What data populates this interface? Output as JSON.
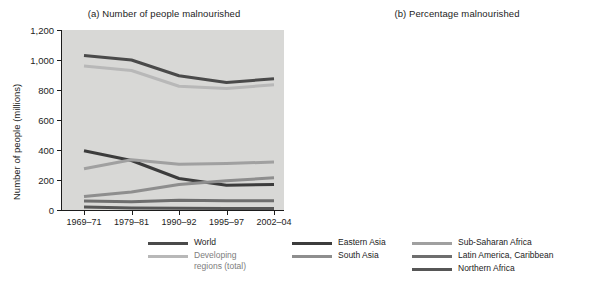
{
  "figure": {
    "panel_a_title": "(a) Number of people malnourished",
    "panel_b_title": "(b) Percentage malnourished"
  },
  "legend": {
    "items": [
      {
        "label": "World",
        "color": "#4a4a4a"
      },
      {
        "label": "Developing\nregions (total)",
        "color": "#b8b8b8"
      },
      {
        "label": "Eastern Asia",
        "color": "#3c3c3c"
      },
      {
        "label": "South Asia",
        "color": "#8e8e8e"
      },
      {
        "label": "Sub-Saharan Africa",
        "color": "#a0a0a0"
      },
      {
        "label": "Latin America, Caribbean",
        "color": "#6e6e6e"
      },
      {
        "label": "Northern Africa",
        "color": "#565656"
      }
    ]
  },
  "chart_data": [
    {
      "type": "line",
      "title": "(a) Number of people malnourished",
      "xlabel": "",
      "ylabel": "Number of people (millions)",
      "categories": [
        "1969–71",
        "1979–81",
        "1990–92",
        "1995–97",
        "2002–04"
      ],
      "ylim": [
        0,
        1200
      ],
      "yticks": [
        0,
        200,
        400,
        600,
        800,
        1000,
        1200
      ],
      "ytick_labels": [
        "0",
        "200",
        "400",
        "600",
        "800",
        "1,000",
        "1,200"
      ],
      "grid": false,
      "legend_position": "below",
      "series": [
        {
          "name": "World",
          "color": "#4a4a4a",
          "values": [
            1030,
            1000,
            895,
            850,
            875
          ]
        },
        {
          "name": "Developing regions (total)",
          "color": "#b8b8b8",
          "values": [
            960,
            930,
            825,
            810,
            835
          ]
        },
        {
          "name": "Eastern Asia",
          "color": "#3c3c3c",
          "values": [
            395,
            330,
            210,
            165,
            170
          ]
        },
        {
          "name": "Sub-Saharan Africa",
          "color": "#a0a0a0",
          "values": [
            275,
            335,
            305,
            310,
            320
          ]
        },
        {
          "name": "South Asia",
          "color": "#8e8e8e",
          "values": [
            90,
            120,
            170,
            195,
            215
          ]
        },
        {
          "name": "Latin America, Caribbean",
          "color": "#6e6e6e",
          "values": [
            60,
            55,
            65,
            62,
            62
          ]
        },
        {
          "name": "Northern Africa",
          "color": "#565656",
          "values": [
            20,
            14,
            11,
            10,
            10
          ]
        }
      ]
    },
    {
      "type": "line",
      "title": "(b) Percentage malnourished",
      "xlabel": "",
      "ylabel": "Percentage",
      "categories": [
        "1969–71",
        "1979–81",
        "1990–92",
        "1995–97",
        "2002–04"
      ],
      "ylim": [
        0,
        50
      ],
      "yticks": [
        0,
        10,
        20,
        30,
        40,
        50
      ],
      "ytick_labels": [
        "0",
        "10",
        "20",
        "30",
        "40",
        "50"
      ],
      "grid": false,
      "legend_position": "below",
      "series": [
        {
          "name": "Eastern Asia",
          "color": "#3c3c3c",
          "values": [
            45,
            30,
            16,
            12,
            12
          ]
        },
        {
          "name": "World",
          "color": "#4a4a4a",
          "values": [
            37,
            29,
            20,
            18,
            17
          ]
        },
        {
          "name": "Sub-Saharan Africa",
          "color": "#a0a0a0",
          "values": [
            37,
            36,
            33,
            34,
            31
          ]
        },
        {
          "name": "Northern Africa",
          "color": "#c2c2c2",
          "values": [
            33,
            25,
            16,
            13.5,
            14
          ]
        },
        {
          "name": "South Asia",
          "color": "#8e8e8e",
          "values": [
            27,
            22,
            17,
            12,
            11
          ]
        },
        {
          "name": "Latin America, Caribbean",
          "color": "#6e6e6e",
          "values": [
            20,
            8,
            4,
            4,
            4
          ]
        }
      ]
    }
  ]
}
